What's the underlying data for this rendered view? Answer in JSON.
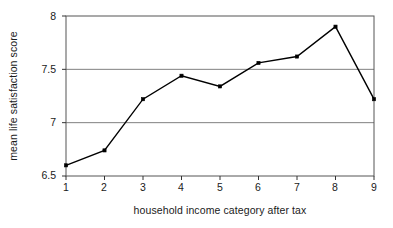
{
  "chart_data": {
    "type": "line",
    "title": "",
    "subtitle": "",
    "xlabel": "household income category after tax",
    "ylabel": "mean life satisfaction score",
    "categories": [
      "1",
      "2",
      "3",
      "4",
      "5",
      "6",
      "7",
      "8",
      "9"
    ],
    "x": [
      1,
      2,
      3,
      4,
      5,
      6,
      7,
      8,
      9
    ],
    "values": [
      6.6,
      6.74,
      7.22,
      7.44,
      7.34,
      7.56,
      7.62,
      7.9,
      7.22
    ],
    "series": [
      {
        "name": "mean life satisfaction score",
        "values": [
          6.6,
          6.74,
          7.22,
          7.44,
          7.34,
          7.56,
          7.62,
          7.9,
          7.22
        ]
      }
    ],
    "xlim": [
      1,
      9
    ],
    "ylim": [
      6.5,
      8
    ],
    "ytick_labels": [
      "6.5",
      "7",
      "7.5",
      "8"
    ],
    "ytick_values": [
      6.5,
      7,
      7.5,
      8
    ],
    "xtick_labels": [
      "1",
      "2",
      "3",
      "4",
      "5",
      "6",
      "7",
      "8",
      "9"
    ],
    "grid": "horizontal",
    "legend": "none",
    "line_color": "#000000",
    "marker": "square",
    "marker_color": "#000000",
    "grid_color": "#808080",
    "frame_color": "#555555",
    "background": "#ffffff",
    "annotations": []
  }
}
